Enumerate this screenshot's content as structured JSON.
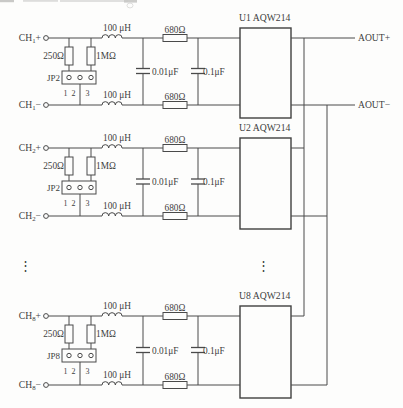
{
  "figure_type": "circuit-schematic",
  "style": {
    "background": "#fdfdfc",
    "wire_color": "#4a4a4a",
    "chip_border_color": "#3f3f3f",
    "text_color": "#3e3e3e",
    "artifact_color": "#bdbdba"
  },
  "components": {
    "inductor_label": "100 μH",
    "series_resistor_label": "680Ω",
    "input_resistor_label": "250Ω",
    "bleed_resistor_label": "1MΩ",
    "capacitor1_label": "0.01μF",
    "capacitor2_label": "0.1μF",
    "jumper_pin_numbers": [
      "1",
      "2",
      "3"
    ]
  },
  "sections": [
    {
      "channel_prefix": "CH",
      "channel_sub": "1",
      "plus_sign": "+",
      "minus_sign": "−",
      "jumper_label": "JP2",
      "chip_label": "U1 AQW214"
    },
    {
      "channel_prefix": "CH",
      "channel_sub": "2",
      "plus_sign": "+",
      "minus_sign": "−",
      "jumper_label": "JP2",
      "chip_label": "U2 AQW214"
    },
    {
      "channel_prefix": "CH",
      "channel_sub": "8",
      "plus_sign": "+",
      "minus_sign": "−",
      "jumper_label": "JP8",
      "chip_label": "U8 AQW214"
    }
  ],
  "outputs": {
    "positive_label": "AOUT+",
    "negative_label": "AOUT−"
  },
  "ellipsis_glyph": "⋮"
}
